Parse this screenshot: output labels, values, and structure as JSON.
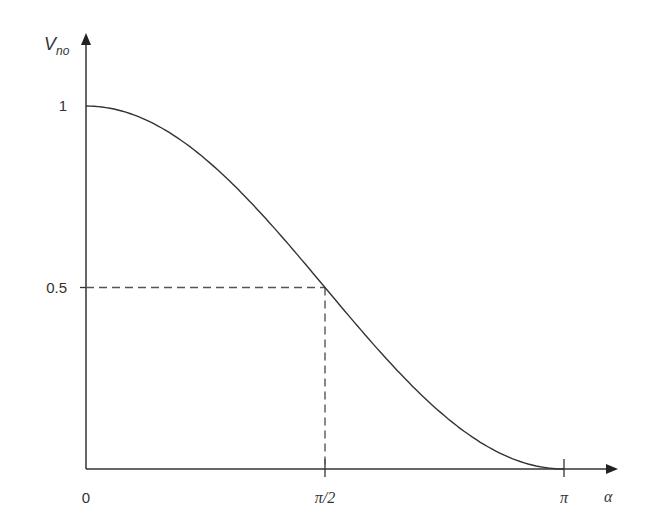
{
  "chart_data": {
    "type": "line",
    "title": "",
    "xlabel": "α",
    "ylabel": "V_no",
    "ylabel_main": "V",
    "ylabel_sub": "no",
    "function": "(1 + cos α) / 2",
    "xlim": [
      0,
      3.14159
    ],
    "ylim": [
      0,
      1
    ],
    "x_ticks": [
      {
        "value": 0,
        "label": "0"
      },
      {
        "value": 1.5708,
        "label": "π/2"
      },
      {
        "value": 3.14159,
        "label": "π"
      }
    ],
    "y_ticks": [
      {
        "value": 1,
        "label": "1"
      },
      {
        "value": 0.5,
        "label": "0.5"
      }
    ],
    "series": [
      {
        "name": "V_no",
        "x": [
          0,
          0.3927,
          0.7854,
          1.1781,
          1.5708,
          1.9635,
          2.3562,
          2.7489,
          3.1416
        ],
        "values": [
          1.0,
          0.962,
          0.854,
          0.691,
          0.5,
          0.309,
          0.146,
          0.038,
          0.0
        ]
      }
    ],
    "annotations": [
      {
        "type": "dashed-guide",
        "x": 1.5708,
        "y": 0.5,
        "description": "dashed lines from (π/2, 0.5) to both axes"
      }
    ],
    "grid": false,
    "legend": null,
    "colors": {
      "line": "#333333",
      "axis": "#333333",
      "guide": "#555555"
    }
  }
}
